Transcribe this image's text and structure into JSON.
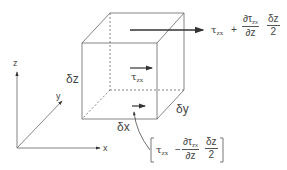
{
  "diagram": {
    "type": "3d-element-stress-diagram",
    "axes": {
      "x_label": "x",
      "y_label": "y",
      "z_label": "z"
    },
    "cube": {
      "dim_x_label": "δx",
      "dim_y_label": "δy",
      "dim_z_label": "δz"
    },
    "stresses": {
      "center": {
        "symbol": "τ",
        "subscript": "zx"
      },
      "top": {
        "symbol": "τ",
        "subscript": "zx",
        "operator": "+",
        "frac1_num": "∂τ",
        "frac1_num_sub": "zx",
        "frac1_den": "∂z",
        "frac2_num": "δz",
        "frac2_den": "2"
      },
      "bottom": {
        "open_bracket": "[",
        "close_bracket": "]",
        "symbol": "τ",
        "subscript": "zx",
        "operator": "−",
        "frac1_num": "∂τ",
        "frac1_num_sub": "zx",
        "frac1_den": "∂z",
        "frac2_num": "δz",
        "frac2_den": "2"
      }
    },
    "colors": {
      "line": "#555555",
      "arrow": "#333333",
      "background": "#ffffff"
    }
  }
}
